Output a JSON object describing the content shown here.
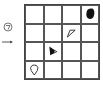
{
  "puzzle": {
    "rows": 4,
    "cols": 4,
    "legend": [
      {
        "icon": "rotate-icon"
      },
      {
        "icon": "arrow-right-icon"
      }
    ],
    "cells": [
      {
        "row": 0,
        "col": 3,
        "shape": "filled-blob"
      },
      {
        "row": 1,
        "col": 2,
        "shape": "outline-triangle"
      },
      {
        "row": 2,
        "col": 1,
        "shape": "filled-triangle-right"
      },
      {
        "row": 3,
        "col": 0,
        "shape": "outline-balloon"
      }
    ]
  }
}
